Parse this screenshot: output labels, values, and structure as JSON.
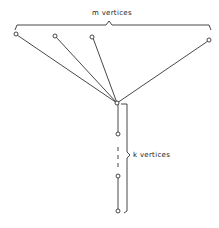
{
  "diagram": {
    "top_label": "m  vertices",
    "side_label": "k  vertices",
    "colors": {
      "line": "#333333",
      "background": "#ffffff"
    },
    "top_nodes": [
      {
        "x": 16,
        "y": 34
      },
      {
        "x": 55,
        "y": 36
      },
      {
        "x": 92,
        "y": 37
      },
      {
        "x": 209,
        "y": 40
      }
    ],
    "hub": {
      "x": 117,
      "y": 103
    },
    "path_nodes": [
      {
        "x": 118,
        "y": 134
      },
      {
        "x": 118,
        "y": 176
      },
      {
        "x": 118,
        "y": 211
      }
    ]
  }
}
